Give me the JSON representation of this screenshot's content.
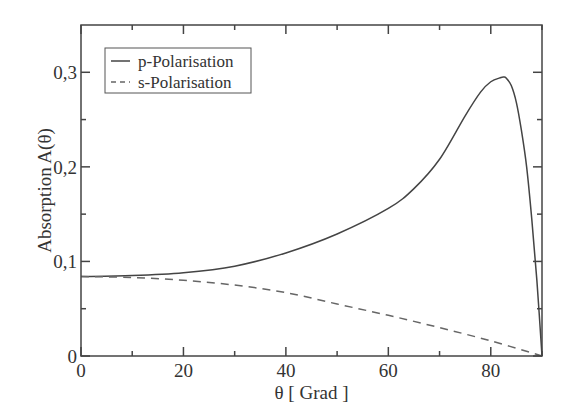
{
  "chart_data": {
    "type": "line",
    "title": "",
    "xlabel": "θ [ Grad ]",
    "ylabel": "Absorption A(θ)",
    "xlim": [
      0,
      90
    ],
    "ylim": [
      0,
      0.35
    ],
    "x_ticks": [
      0,
      20,
      40,
      60,
      80
    ],
    "x_tick_labels": [
      "0",
      "20",
      "40",
      "60",
      "80"
    ],
    "x_minor_ticks": [
      10,
      30,
      50,
      70,
      90
    ],
    "y_ticks": [
      0,
      0.1,
      0.2,
      0.3
    ],
    "y_tick_labels": [
      "0",
      "0,1",
      "0,2",
      "0,3"
    ],
    "y_minor_ticks": [
      0.05,
      0.15,
      0.25
    ],
    "grid": false,
    "legend_position": "upper-left",
    "series": [
      {
        "name": "p-Polarisation",
        "style": "solid",
        "color": "#444444",
        "x": [
          0,
          10,
          20,
          30,
          40,
          50,
          60,
          65,
          70,
          75,
          78,
          80,
          82,
          82.5,
          83,
          84,
          85,
          86,
          87,
          88,
          89,
          90
        ],
        "values": [
          0.084,
          0.085,
          0.088,
          0.095,
          0.109,
          0.129,
          0.156,
          0.177,
          0.208,
          0.254,
          0.279,
          0.29,
          0.2945,
          0.295,
          0.294,
          0.286,
          0.268,
          0.238,
          0.2,
          0.145,
          0.08,
          0.0
        ]
      },
      {
        "name": "s-Polarisation",
        "style": "dashed",
        "color": "#666666",
        "x": [
          0,
          10,
          20,
          30,
          40,
          50,
          60,
          70,
          80,
          90
        ],
        "values": [
          0.084,
          0.083,
          0.08,
          0.075,
          0.067,
          0.055,
          0.043,
          0.03,
          0.016,
          0.0
        ]
      }
    ]
  },
  "plot_area": {
    "left": 81,
    "top": 25,
    "right": 542,
    "bottom": 356
  },
  "legend": {
    "items": [
      {
        "label": "p-Polarisation"
      },
      {
        "label": "s-Polarisation"
      }
    ]
  },
  "axes": {
    "xlabel": "θ [ Grad ]",
    "ylabel": "Absorption A(θ)"
  }
}
